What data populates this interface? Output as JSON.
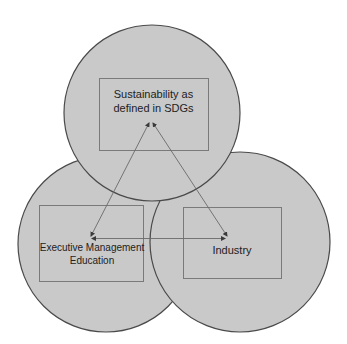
{
  "diagram": {
    "type": "venn-like overlapping circles with linked boxes",
    "colors": {
      "background": "#ffffff",
      "circle_fill": "#c9c9c9",
      "circle_stroke": "#4a4a4a",
      "box_stroke": "#7a7a7a",
      "arrow_stroke": "#6a6a6a",
      "text": "#222222"
    },
    "nodes": [
      {
        "id": "sdg",
        "label_lines": [
          "Sustainability as",
          "defined in SDGs"
        ],
        "label": "Sustainability as defined in SDGs",
        "position": "top"
      },
      {
        "id": "eme",
        "label_lines": [
          "Executive Management",
          "Education"
        ],
        "label": "Executive Management Education",
        "position": "bottom-left"
      },
      {
        "id": "industry",
        "label_lines": [
          "Industry"
        ],
        "label": "Industry",
        "position": "bottom-right"
      }
    ],
    "edges": [
      {
        "from": "eme",
        "to": "sdg",
        "arrow": "both"
      },
      {
        "from": "industry",
        "to": "sdg",
        "arrow": "both"
      },
      {
        "from": "eme",
        "to": "industry",
        "arrow": "both"
      }
    ]
  }
}
